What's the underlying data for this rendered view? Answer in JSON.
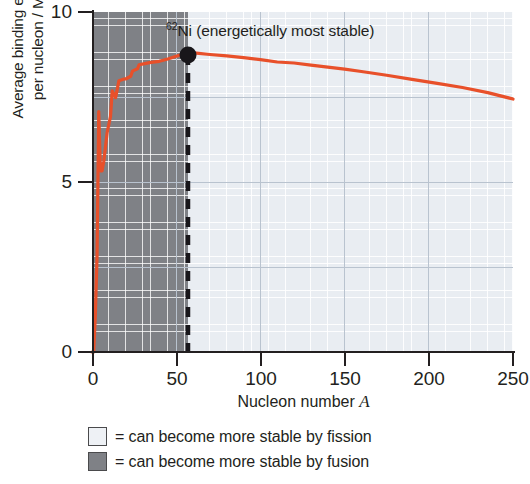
{
  "chart_data": {
    "type": "line",
    "title": "",
    "xlabel": "Nucleon number A",
    "ylabel": "Average binding energy per nucleon / MeV",
    "xlim": [
      0,
      250
    ],
    "ylim": [
      0,
      10
    ],
    "xticks": [
      0,
      50,
      100,
      150,
      200,
      250
    ],
    "yticks": [
      0,
      5,
      10
    ],
    "grid": true,
    "legend_position": "below-axes",
    "annotations": [
      {
        "text": "62Ni (energetically most stable)",
        "x": 56,
        "y": 8.75
      }
    ],
    "series": [
      {
        "name": "Average binding energy per nucleon",
        "color": "#e8502a",
        "x": [
          0,
          1,
          2,
          3,
          4,
          5,
          6,
          7,
          9,
          11,
          12,
          14,
          16,
          19,
          20,
          23,
          24,
          27,
          28,
          32,
          35,
          40,
          45,
          50,
          56,
          62,
          70,
          80,
          90,
          100,
          110,
          120,
          130,
          140,
          150,
          160,
          175,
          190,
          205,
          220,
          235,
          250
        ],
        "y": [
          0,
          0,
          1.11,
          2.83,
          7.07,
          5.33,
          5.33,
          5.61,
          6.46,
          6.93,
          7.68,
          7.48,
          7.98,
          8.03,
          8.03,
          8.11,
          8.26,
          8.33,
          8.45,
          8.49,
          8.52,
          8.55,
          8.62,
          8.7,
          8.79,
          8.79,
          8.75,
          8.71,
          8.66,
          8.6,
          8.53,
          8.5,
          8.44,
          8.38,
          8.32,
          8.25,
          8.14,
          8.02,
          7.9,
          7.78,
          7.63,
          7.44
        ]
      }
    ],
    "regions": [
      {
        "name": "fusion",
        "x_range": [
          0,
          56
        ],
        "color": "#7f8186",
        "label": "can become more stable by fusion"
      },
      {
        "name": "fission",
        "x_range": [
          56,
          250
        ],
        "color": "#e9edf2",
        "label": "can become more stable by fission"
      }
    ]
  },
  "axes": {
    "y_title_line1": "Average binding energy",
    "y_title_line2": "per nucleon / MeV",
    "x_title_text": "Nucleon number ",
    "x_title_symbol": "A",
    "y_tick_labels": [
      "10",
      "5",
      "0"
    ],
    "x_tick_labels": [
      "0",
      "50",
      "100",
      "150",
      "200",
      "250"
    ]
  },
  "annotation": {
    "isotope_mass": "62",
    "isotope_symbol": "Ni",
    "note": " (energetically most stable)"
  },
  "legend": {
    "items": [
      {
        "swatch_color": "#eef1f5",
        "label": "= can become more stable by fission"
      },
      {
        "swatch_color": "#7f8186",
        "label": "= can become more stable by fusion"
      }
    ]
  },
  "colors": {
    "curve": "#e8502a",
    "fusion_region": "#7f8186",
    "fission_region": "#e9edf2",
    "grid_major": "#b9c3cf",
    "axis": "#231f20",
    "marker": "#18161a"
  }
}
